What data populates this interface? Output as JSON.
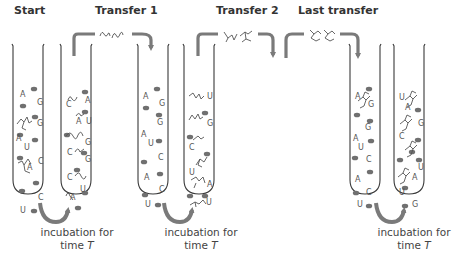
{
  "stages": [
    {
      "label": "Start",
      "x": 14
    },
    {
      "label": "Transfer 1",
      "x": 95
    },
    {
      "label": "Transfer 2",
      "x": 216
    },
    {
      "label": "Last transfer",
      "x": 298
    }
  ],
  "captions": [
    {
      "line1": "incubation for",
      "line2_prefix": "time ",
      "line2_var": "T",
      "x": 22
    },
    {
      "line1": "incubation for",
      "line2_prefix": "time ",
      "line2_var": "T",
      "x": 146
    },
    {
      "line1": "incubation for",
      "line2_prefix": "time ",
      "line2_var": "T",
      "x": 359
    }
  ],
  "nucleotides": [
    "A",
    "U",
    "G",
    "C"
  ],
  "colors": {
    "tube_outline": "#3a3a3a",
    "arrow": "#7a7a7a",
    "bead": "#707070",
    "letters": "#555555"
  },
  "tubes": [
    {
      "id": "tube-1",
      "x": 12,
      "letters": [
        [
          "A",
          20,
          97
        ],
        [
          "G",
          37,
          105
        ],
        [
          "G",
          37,
          126
        ],
        [
          "A",
          16,
          141
        ],
        [
          "U",
          24,
          150
        ],
        [
          "C",
          38,
          164
        ],
        [
          "A",
          27,
          170
        ],
        [
          "C",
          38,
          200
        ],
        [
          "U",
          20,
          213
        ]
      ]
    },
    {
      "id": "tube-2",
      "x": 60,
      "letters": [
        [
          "C",
          66,
          107
        ],
        [
          "A",
          85,
          103
        ],
        [
          "A",
          76,
          124
        ],
        [
          "U",
          86,
          124
        ],
        [
          "G",
          85,
          145
        ],
        [
          "C",
          67,
          155
        ],
        [
          "G",
          85,
          162
        ],
        [
          "C",
          67,
          180
        ],
        [
          "U",
          80,
          192
        ],
        [
          "A",
          70,
          200
        ]
      ]
    },
    {
      "id": "tube-3",
      "x": 137,
      "letters": [
        [
          "A",
          143,
          99
        ],
        [
          "G",
          159,
          106
        ],
        [
          "G",
          157,
          125
        ],
        [
          "A",
          141,
          137
        ],
        [
          "U",
          148,
          146
        ],
        [
          "C",
          158,
          160
        ],
        [
          "A",
          144,
          180
        ],
        [
          "C",
          159,
          192
        ],
        [
          "U",
          145,
          207
        ]
      ]
    },
    {
      "id": "tube-4",
      "x": 183,
      "letters": [
        [
          "U",
          207,
          99
        ],
        [
          "G",
          207,
          126
        ],
        [
          "C",
          189,
          150
        ],
        [
          "U",
          189,
          175
        ],
        [
          "A",
          207,
          187
        ],
        [
          "U",
          206,
          205
        ]
      ]
    },
    {
      "id": "tube-5",
      "x": 349,
      "letters": [
        [
          "A",
          355,
          99
        ],
        [
          "G",
          368,
          107
        ],
        [
          "G",
          365,
          130
        ],
        [
          "A",
          353,
          141
        ],
        [
          "U",
          358,
          150
        ],
        [
          "C",
          366,
          162
        ],
        [
          "A",
          355,
          182
        ],
        [
          "C",
          366,
          195
        ],
        [
          "U",
          357,
          207
        ]
      ]
    },
    {
      "id": "tube-6",
      "x": 393,
      "letters": [
        [
          "U",
          399,
          100
        ],
        [
          "A",
          405,
          110
        ],
        [
          "G",
          418,
          126
        ],
        [
          "C",
          399,
          139
        ],
        [
          "U",
          418,
          170
        ],
        [
          "A",
          412,
          180
        ],
        [
          "U",
          399,
          195
        ],
        [
          "G",
          412,
          207
        ]
      ]
    }
  ]
}
